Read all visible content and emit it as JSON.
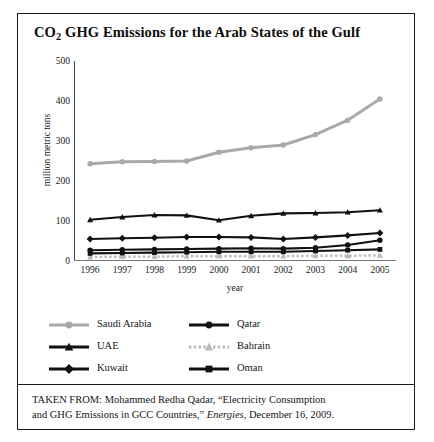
{
  "title": {
    "pre": "CO",
    "sub": "2",
    "post": " GHG Emissions for the Arab States of the Gulf"
  },
  "source": {
    "line1": "TAKEN FROM: Mohammed Redha Qadar, “Electricity Consumption",
    "line2_a": "and GHG Emissions in GCC Countries,” ",
    "line2_em": "Energies",
    "line2_b": ", December 16, 2009."
  },
  "colors": {
    "dark": "#111111",
    "saudi": "#a9a9a9",
    "bahrain": "#b9b9b9",
    "axis": "#555555"
  },
  "chart_data": {
    "type": "line",
    "title": "CO2 GHG Emissions for the Arab States of the Gulf",
    "xlabel": "year",
    "ylabel": "million metric tons",
    "categories": [
      "1996",
      "1997",
      "1998",
      "1999",
      "2000",
      "2001",
      "2002",
      "2003",
      "2004",
      "2005"
    ],
    "x": [
      1996,
      1997,
      1998,
      1999,
      2000,
      2001,
      2002,
      2003,
      2004,
      2005
    ],
    "ylim": [
      0,
      500
    ],
    "yticks": [
      0,
      100,
      200,
      300,
      400,
      500
    ],
    "grid": false,
    "legend_position": "below-axes",
    "series": [
      {
        "name": "Saudi Arabia",
        "marker": "circle",
        "color": "#a9a9a9",
        "values": [
          243,
          248,
          249,
          250,
          272,
          283,
          290,
          316,
          352,
          405
        ]
      },
      {
        "name": "Qatar",
        "marker": "circle",
        "color": "#111111",
        "values": [
          27,
          28,
          29,
          30,
          31,
          32,
          31,
          33,
          40,
          52
        ]
      },
      {
        "name": "UAE",
        "marker": "triangle",
        "color": "#111111",
        "values": [
          103,
          110,
          115,
          114,
          102,
          113,
          119,
          120,
          122,
          127
        ]
      },
      {
        "name": "Bahrain",
        "marker": "triangle",
        "color": "#b9b9b9",
        "values": [
          10,
          11,
          11,
          12,
          12,
          12,
          12,
          13,
          13,
          14
        ]
      },
      {
        "name": "Kuwait",
        "marker": "diamond",
        "color": "#111111",
        "values": [
          55,
          57,
          58,
          60,
          60,
          59,
          55,
          59,
          64,
          70
        ]
      },
      {
        "name": "Oman",
        "marker": "square",
        "color": "#111111",
        "values": [
          19,
          20,
          21,
          22,
          23,
          23,
          23,
          25,
          27,
          29
        ]
      }
    ]
  }
}
